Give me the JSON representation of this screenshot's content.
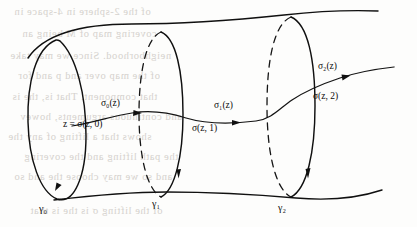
{
  "figure": {
    "background_color": "#fdfdfc",
    "ink_color": "#101010",
    "ghost_text_color": "#cfcbc6"
  },
  "labels": {
    "sigma_0": "σ₀(z)",
    "sigma_1": "σ₁(z)",
    "sigma_2": "σ₂(z)",
    "point_0": "z = σ(z, 0)",
    "point_1": "σ(z, 1)",
    "point_2": "σ(z, 2)",
    "gamma_0": "γ₀",
    "gamma_1": "γ₁",
    "gamma_2": "γ₂"
  },
  "ghost_text": {
    "lines": [
      "of the 2-sphere in  4-space  in",
      "covering  map  of  M  being  an",
      "neighborhood. Since we may take",
      "of the map over  and p  and for",
      "that component. That  is, the  is",
      "and continuous  arguments, howev",
      "shows that a  lifting  of  any  the",
      "the path lifting  and  the  covering",
      "and so we may  choose the  and so",
      "of the  lifting   σ  is  the  is  that"
    ]
  }
}
